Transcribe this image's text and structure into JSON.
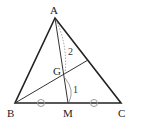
{
  "diagram": {
    "points": {
      "A": {
        "label": "A",
        "x": 55,
        "y": 18
      },
      "B": {
        "label": "B",
        "x": 15,
        "y": 103
      },
      "C": {
        "label": "C",
        "x": 121,
        "y": 103
      },
      "M": {
        "label": "M",
        "x": 68,
        "y": 103
      },
      "G": {
        "label": "G",
        "x": 64,
        "y": 76
      }
    },
    "segment_ratio": {
      "AG": "2",
      "GM": "1"
    },
    "equal_marks": "BM = MC",
    "line_color": "#222222"
  }
}
